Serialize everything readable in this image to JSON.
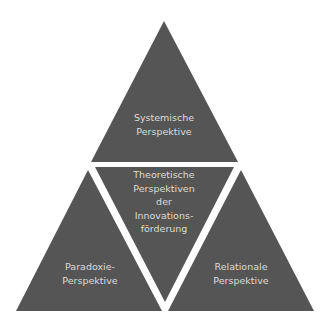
{
  "diagram": {
    "type": "triangle-segmentation",
    "colors": {
      "fill": "#555555",
      "text": "#dcdcdc",
      "gap": "#ffffff",
      "background": "#ffffff"
    },
    "segments": {
      "top": {
        "lines": [
          "Systemische",
          "Perspektive"
        ]
      },
      "center": {
        "lines": [
          "Theoretische",
          "Perspektiven",
          "der",
          "Innovations-",
          "förderung"
        ]
      },
      "left": {
        "lines": [
          "Paradoxie-",
          "Perspektive"
        ]
      },
      "right": {
        "lines": [
          "Relationale",
          "Perspektive"
        ]
      }
    }
  }
}
